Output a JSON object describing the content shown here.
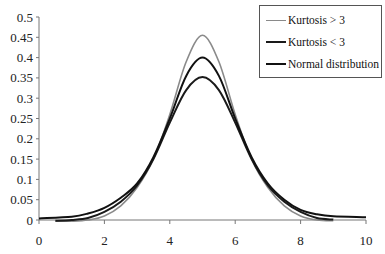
{
  "chart_data": {
    "type": "line",
    "title": "",
    "xlabel": "",
    "ylabel": "",
    "xlim": [
      0,
      10
    ],
    "ylim": [
      0,
      0.5
    ],
    "x_ticks": [
      "0",
      "2",
      "4",
      "6",
      "8",
      "10"
    ],
    "y_ticks": [
      "0",
      "0.05",
      "0.1",
      "0.15",
      "0.2",
      "0.25",
      "0.3",
      "0.35",
      "0.4",
      "0.45",
      "0.5"
    ],
    "grid": false,
    "legend_position": "top-right",
    "series": [
      {
        "name": "Kurtosis > 3",
        "color": "#8a8a8a",
        "x": [
          0.5,
          1,
          1.5,
          2,
          2.5,
          3,
          3.5,
          4,
          4.5,
          5,
          5.5,
          6,
          6.5,
          7,
          7.5,
          8,
          8.5,
          9
        ],
        "values": [
          -0.003,
          -0.003,
          0.0,
          0.01,
          0.035,
          0.08,
          0.15,
          0.26,
          0.39,
          0.455,
          0.39,
          0.26,
          0.15,
          0.08,
          0.035,
          0.01,
          0.0,
          -0.002
        ]
      },
      {
        "name": "Kurtosis < 3",
        "color": "#1a1a1a",
        "x": [
          0.5,
          1,
          1.5,
          2,
          2.5,
          3,
          3.5,
          4,
          4.5,
          5,
          5.5,
          6,
          6.5,
          7,
          7.5,
          8,
          8.5,
          9
        ],
        "values": [
          -0.002,
          0.0,
          0.005,
          0.02,
          0.045,
          0.085,
          0.15,
          0.24,
          0.32,
          0.352,
          0.32,
          0.24,
          0.15,
          0.085,
          0.045,
          0.02,
          0.005,
          0.001
        ]
      },
      {
        "name": "Normal distribution",
        "color": "#111111",
        "x": [
          0,
          1,
          1.5,
          2,
          2.5,
          3,
          3.5,
          4,
          4.5,
          5,
          5.5,
          6,
          6.5,
          7,
          7.5,
          8,
          8.5,
          9,
          10
        ],
        "values": [
          0.004,
          0.008,
          0.016,
          0.03,
          0.055,
          0.09,
          0.155,
          0.25,
          0.355,
          0.4,
          0.355,
          0.25,
          0.155,
          0.09,
          0.05,
          0.025,
          0.014,
          0.009,
          0.007
        ]
      }
    ]
  },
  "legend": {
    "items": [
      {
        "label": "Kurtosis > 3",
        "color": "#8a8a8a"
      },
      {
        "label": "Kurtosis < 3",
        "color": "#1a1a1a"
      },
      {
        "label": "Normal distribution",
        "color": "#111111"
      }
    ]
  }
}
